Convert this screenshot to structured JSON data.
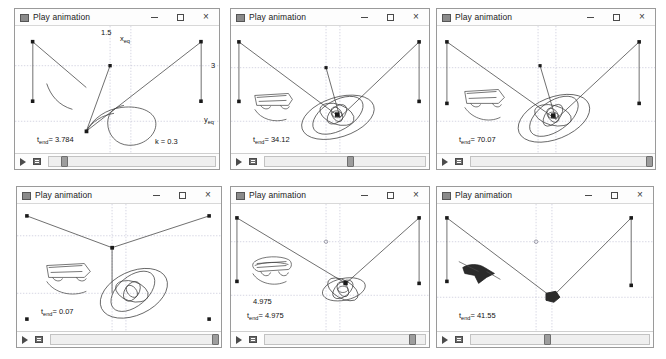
{
  "window": {
    "title": "Play animation",
    "minimize_label": "–",
    "maximize_label": "□",
    "close_label": "×"
  },
  "toolbar": {
    "play_icon": "play-icon",
    "frames_icon": "frames-icon"
  },
  "axes": {
    "x_eq_label": "x",
    "x_eq_sub": "eq",
    "y_eq_label": "y",
    "y_eq_sub": "eq",
    "x_tick": "1.5",
    "y_tick": "3"
  },
  "panels": [
    {
      "id": "panel-1",
      "title": "Play animation",
      "t_end_label": "t",
      "t_end_sub": "end",
      "t_end_value": "= 3.784",
      "t_end_full": "t_end = 3.784",
      "k_label": "k = 0.3",
      "extra_label": null,
      "show_axis_labels": true,
      "slider_pos_pct": 7
    },
    {
      "id": "panel-2",
      "title": "Play animation",
      "t_end_label": "t",
      "t_end_sub": "end",
      "t_end_value": "= 34.12",
      "t_end_full": "t_end = 34.12",
      "k_label": null,
      "extra_label": null,
      "show_axis_labels": false,
      "slider_pos_pct": 51
    },
    {
      "id": "panel-3",
      "title": "Play animation",
      "t_end_label": "t",
      "t_end_sub": "end",
      "t_end_value": "= 70.07",
      "t_end_full": "t_end = 70.07",
      "k_label": null,
      "extra_label": null,
      "show_axis_labels": false,
      "slider_pos_pct": 97
    },
    {
      "id": "panel-4",
      "title": "Play animation",
      "t_end_label": "t",
      "t_end_sub": "end",
      "t_end_value": "= 0.07",
      "t_end_full": "t_end = 0.07",
      "k_label": null,
      "extra_label": null,
      "show_axis_labels": false,
      "slider_pos_pct": 97
    },
    {
      "id": "panel-5",
      "title": "Play animation",
      "t_end_label": "t",
      "t_end_sub": "end",
      "t_end_value": "= 4.975",
      "t_end_full": "t_end = 4.975",
      "k_label": null,
      "extra_label": "4.975",
      "show_axis_labels": false,
      "slider_pos_pct": 90
    },
    {
      "id": "panel-6",
      "title": "Play animation",
      "t_end_label": "t",
      "t_end_sub": "end",
      "t_end_value": "= 41.55",
      "t_end_full": "t_end = 41.55",
      "k_label": null,
      "extra_label": null,
      "show_axis_labels": false,
      "slider_pos_pct": 41
    }
  ],
  "colors": {
    "stroke": "#3c3c3c",
    "grid": "#b9b9cf",
    "marker": "#1a1a1a",
    "border": "#9a9a9a",
    "slider_handle": "#9d9d9d"
  }
}
